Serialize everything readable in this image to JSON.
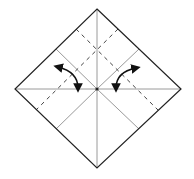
{
  "diagram": {
    "title": "Origami fold diagram: square base with valley fold creases and fold arrows",
    "colors": {
      "outline": "#222222",
      "crease": "#9a9a9a",
      "dashed": "#444444",
      "arrow": "#111111",
      "background": "#ffffff"
    },
    "square": {
      "top": [
        97,
        9
      ],
      "right": [
        181,
        89
      ],
      "bottom": [
        97,
        168
      ],
      "left": [
        15,
        89
      ],
      "center": [
        97,
        89
      ]
    },
    "creases": [
      {
        "name": "vertical-crease",
        "from": [
          97,
          9
        ],
        "to": [
          97,
          168
        ]
      },
      {
        "name": "horizontal-crease",
        "from": [
          15,
          89
        ],
        "to": [
          181,
          89
        ]
      },
      {
        "name": "upper-left-diagonal-crease",
        "from": [
          56,
          49
        ],
        "to": [
          97,
          89
        ]
      },
      {
        "name": "upper-right-diagonal-crease",
        "from": [
          139,
          49
        ],
        "to": [
          97,
          89
        ]
      },
      {
        "name": "lower-left-diagonal-crease",
        "from": [
          56,
          129
        ],
        "to": [
          97,
          89
        ]
      },
      {
        "name": "lower-right-diagonal-crease",
        "from": [
          139,
          129
        ],
        "to": [
          97,
          89
        ]
      }
    ],
    "dashed_lines": [
      {
        "name": "valley-fold-line-left",
        "from": [
          118,
          29
        ],
        "to": [
          36,
          110
        ]
      },
      {
        "name": "valley-fold-line-right",
        "from": [
          76,
          29
        ],
        "to": [
          158,
          110
        ]
      }
    ],
    "arrows": [
      {
        "name": "fold-arrow-left",
        "path": "M 58 67 Q 78 72 78 88",
        "start": [
          58,
          67
        ],
        "end": [
          78,
          88
        ]
      },
      {
        "name": "fold-arrow-right",
        "path": "M 136 68 Q 116 72 116 88",
        "start": [
          136,
          68
        ],
        "end": [
          116,
          88
        ]
      }
    ]
  }
}
